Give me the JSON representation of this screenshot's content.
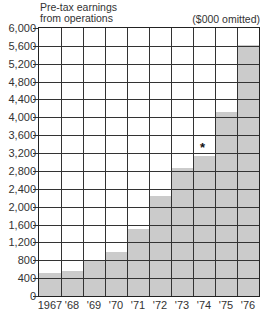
{
  "chart_data": {
    "type": "bar",
    "title": "Pre-tax earnings from operations",
    "title_lines": [
      "Pre-tax earnings",
      "from operations"
    ],
    "units": "($000 omitted)",
    "xlabel": "",
    "ylabel": "",
    "categories": [
      "1967",
      "'68",
      "'69",
      "'70",
      "'71",
      "'72",
      "'73",
      "'74",
      "'75",
      "'76"
    ],
    "values": [
      510,
      550,
      800,
      990,
      1510,
      2240,
      2860,
      3130,
      4130,
      5620
    ],
    "ylim": [
      0,
      6000
    ],
    "yticks": [
      0,
      400,
      800,
      1200,
      1600,
      2000,
      2400,
      2800,
      3200,
      3600,
      4000,
      4400,
      4800,
      5200,
      5600,
      6000
    ],
    "ytick_labels": [
      "0",
      "400",
      "800",
      "1,200",
      "1,600",
      "2,000",
      "2,400",
      "2,800",
      "3,200",
      "3,600",
      "4,000",
      "4,400",
      "4,800",
      "5,200",
      "5,600",
      "6,000"
    ],
    "grid": true,
    "bar_color": "#cbcbcb",
    "annotations": [
      {
        "category": "'74",
        "text": "*"
      }
    ]
  }
}
